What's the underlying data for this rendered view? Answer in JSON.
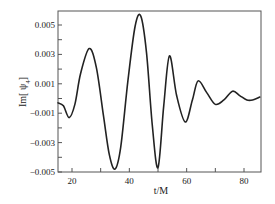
{
  "chart_data": {
    "type": "line",
    "title": "",
    "xlabel": "t/M",
    "ylabel": "Im[ ψ4 ]",
    "xlim": [
      15,
      86
    ],
    "ylim": [
      -0.005,
      0.006
    ],
    "xticks": [
      20,
      30,
      40,
      50,
      60,
      70,
      80
    ],
    "xtick_labels": [
      "20",
      "40",
      "60",
      "80"
    ],
    "xtick_labeled_values": [
      20,
      40,
      60,
      80
    ],
    "yticks": [
      -0.005,
      -0.004,
      -0.003,
      -0.002,
      -0.001,
      0.0,
      0.001,
      0.002,
      0.003,
      0.004,
      0.005
    ],
    "ytick_labels": [
      "0.005",
      "0.003",
      "0.001",
      "-0.001",
      "-0.003",
      "-0.005"
    ],
    "ytick_labeled_values": [
      0.005,
      0.003,
      0.001,
      -0.001,
      -0.003,
      -0.005
    ],
    "grid": false,
    "legend": null,
    "line_color": "#222222",
    "series": [
      {
        "name": "Im[ψ4]",
        "x": [
          15,
          17,
          19,
          21,
          23,
          26,
          28.5,
          31,
          33,
          35,
          37,
          39.5,
          42,
          44,
          46,
          48,
          50,
          52,
          54,
          56.5,
          59.5,
          62,
          64,
          67,
          70,
          73,
          76,
          78.5,
          81,
          83,
          85.5
        ],
        "values": [
          -0.0003,
          -0.0005,
          -0.0013,
          -0.0004,
          0.0017,
          0.0034,
          0.0021,
          -0.0012,
          -0.0038,
          -0.0048,
          -0.0033,
          0.0012,
          0.0049,
          0.0056,
          0.0031,
          -0.0018,
          -0.0047,
          -0.0005,
          0.0029,
          0.0002,
          -0.0016,
          -0.0001,
          0.0012,
          0.0004,
          -0.0004,
          -0.0001,
          0.0005,
          0.0002,
          -0.0001,
          -0.0001,
          0.0001
        ]
      }
    ]
  }
}
